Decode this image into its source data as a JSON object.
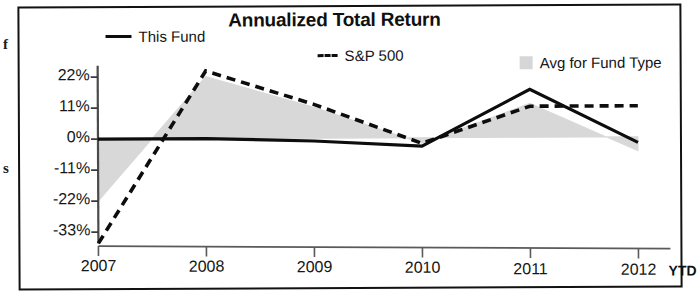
{
  "scraps": {
    "left_top": "f",
    "left_mid": "s"
  },
  "chart_data": {
    "type": "line",
    "title": "Annualized Total Return",
    "xlabel": "",
    "ylabel": "",
    "grid": false,
    "legend_position": "top",
    "ylim": [
      -37,
      26
    ],
    "ytick_labels": [
      "22%",
      "11%",
      "0%",
      "-11%",
      "-22%",
      "-33%"
    ],
    "ytick_values": [
      22,
      11,
      0,
      -11,
      -22,
      -33
    ],
    "categories": [
      "2007",
      "2008",
      "2009",
      "2010",
      "2011",
      "2012"
    ],
    "xtick_labels": [
      "2007",
      "2008",
      "2009",
      "2010",
      "2011",
      "2012"
    ],
    "xaxis_suffix": "YTD",
    "series": [
      {
        "name": "This Fund",
        "style": "solid",
        "color": "#0d0d0d",
        "values": [
          0,
          0,
          -1,
          -3,
          17,
          -2
        ]
      },
      {
        "name": "S&P 500",
        "style": "dashed",
        "color": "#0d0d0d",
        "values": [
          -37,
          24,
          12,
          -2,
          11,
          11
        ]
      },
      {
        "name": "Avg for Fund Type",
        "style": "area",
        "color": "#d6d6d6",
        "values": [
          -22,
          22,
          11,
          -2,
          12,
          -5
        ]
      }
    ],
    "legend": [
      {
        "label": "This Fund",
        "marker": "solid-line"
      },
      {
        "label": "S&P 500",
        "marker": "dashed-line"
      },
      {
        "label": "Avg for Fund Type",
        "marker": "gray-square"
      }
    ]
  }
}
